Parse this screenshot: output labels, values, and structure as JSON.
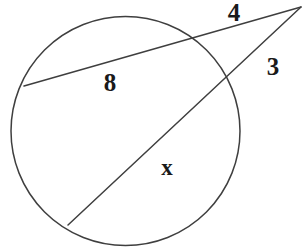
{
  "figure": {
    "kind": "circle-secant-diagram",
    "background_color": "#ffffff",
    "stroke_color": "#3f3f3f",
    "label_color": "#1a1a1a",
    "stroke_width": 1.5
  },
  "chart_data": {
    "type": "diagram",
    "title": "",
    "circle": {
      "cx": 125.5,
      "cy": 131,
      "r": 114.5,
      "left": 11,
      "right": 240,
      "top": 22,
      "bottom": 240
    },
    "external_point": {
      "x": 301,
      "y": 7
    },
    "secants": [
      {
        "name": "upper-secant",
        "external_label": "4",
        "chord_label": "8",
        "from": {
          "x": 301,
          "y": 7
        },
        "near_intersection": {
          "x": 188,
          "y": 41
        },
        "far_intersection": {
          "x": 24,
          "y": 86
        }
      },
      {
        "name": "lower-secant",
        "external_label": "3",
        "chord_label": "x",
        "from": {
          "x": 301,
          "y": 7
        },
        "near_intersection": {
          "x": 224,
          "y": 84
        },
        "far_intersection": {
          "x": 68,
          "y": 225
        }
      }
    ]
  },
  "labels": {
    "external_upper": {
      "text": "4",
      "x": 234,
      "y": 15,
      "size": 25
    },
    "external_lower": {
      "text": "3",
      "x": 273,
      "y": 69,
      "size": 25
    },
    "chord_upper": {
      "text": "8",
      "x": 110,
      "y": 85,
      "size": 25
    },
    "chord_lower": {
      "text": "x",
      "x": 167,
      "y": 170,
      "size": 23
    }
  }
}
